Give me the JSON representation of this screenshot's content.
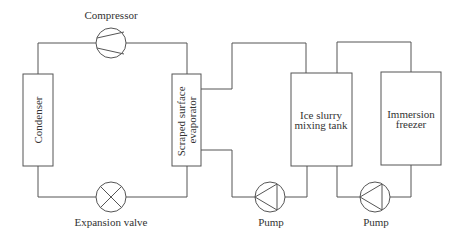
{
  "diagram": {
    "type": "refrigeration ice slurry system schematic",
    "components": {
      "compressor": {
        "label": "Compressor"
      },
      "condenser": {
        "label": "Condenser"
      },
      "expansion_valve": {
        "label": "Expansion valve"
      },
      "evaporator": {
        "label_line1": "Scraped surface",
        "label_line2": "evaporator"
      },
      "tank": {
        "label_line1": "Ice slurry",
        "label_line2": "mixing tank"
      },
      "freezer": {
        "label_line1": "Immersion",
        "label_line2": "freezer"
      },
      "pump1": {
        "label": "Pump"
      },
      "pump2": {
        "label": "Pump"
      }
    },
    "colors": {
      "line": "#555555",
      "text": "#333333",
      "background": "#ffffff"
    }
  }
}
